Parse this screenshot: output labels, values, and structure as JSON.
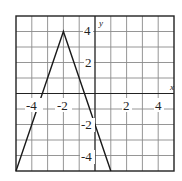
{
  "chart_data": {
    "type": "line",
    "title": "",
    "xlabel": "x",
    "ylabel": "y",
    "xlim": [
      -5,
      5
    ],
    "ylim": [
      -5,
      5
    ],
    "grid": true,
    "grid_step": 1,
    "x_ticks": [
      -4,
      -2,
      2,
      4
    ],
    "y_ticks": [
      4,
      2,
      -2,
      -4
    ],
    "x_tick_labels": [
      "-4",
      "-2",
      "2",
      "4"
    ],
    "y_tick_labels": [
      "4",
      "2",
      "-2",
      "-4"
    ],
    "legend": null,
    "series": [
      {
        "name": "y = -3|x + 2| + 4",
        "equation": "y = -3|x+2| + 4",
        "points": [
          [
            -5,
            -5
          ],
          [
            -2,
            4
          ],
          [
            1,
            -5
          ]
        ],
        "vertex": [
          -2,
          4
        ],
        "color": "#1a1a1a"
      }
    ]
  },
  "labels": {
    "x_axis": "x",
    "y_axis": "y",
    "x_ticks": [
      "-4",
      "-2",
      "2",
      "4"
    ],
    "y_ticks": [
      "4",
      "2",
      "-2",
      "-4"
    ]
  }
}
